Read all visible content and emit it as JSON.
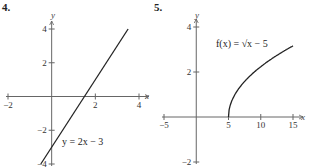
{
  "chart_data": [
    {
      "number": "4.",
      "type": "line",
      "title": "",
      "xlabel": "x",
      "ylabel": "y",
      "xlim": [
        -2,
        4
      ],
      "ylim": [
        -4,
        4
      ],
      "xticks": [
        -2,
        2,
        4
      ],
      "yticks": [
        4,
        2,
        -2,
        -4
      ],
      "xtick_labels": [
        "−2",
        "2",
        "4"
      ],
      "ytick_labels": [
        "4",
        "2",
        "−2",
        "−4"
      ],
      "grid": false,
      "annotation": "y = 2x − 3",
      "series": [
        {
          "name": "y = 2x − 3",
          "x": [
            -0.5,
            3.5
          ],
          "y": [
            -4,
            4
          ]
        }
      ]
    },
    {
      "number": "5.",
      "type": "line",
      "title": "",
      "xlabel": "x",
      "ylabel": "y",
      "xlim": [
        -5,
        15
      ],
      "ylim": [
        -2,
        4
      ],
      "xticks": [
        -5,
        5,
        10,
        15
      ],
      "yticks": [
        4,
        2,
        -2
      ],
      "xtick_labels": [
        "−5",
        "5",
        "10",
        "15"
      ],
      "ytick_labels": [
        "4",
        "2",
        "−2"
      ],
      "grid": false,
      "annotation": "f(x) = √x − 5",
      "series": [
        {
          "name": "f(x) = √(x − 5)",
          "x": [
            5,
            5.25,
            6,
            7,
            8,
            9,
            10,
            11,
            12,
            13,
            14,
            15
          ],
          "y": [
            0,
            0.5,
            1,
            1.414,
            1.732,
            2,
            2.236,
            2.449,
            2.646,
            2.828,
            3,
            3.162
          ]
        }
      ]
    }
  ]
}
